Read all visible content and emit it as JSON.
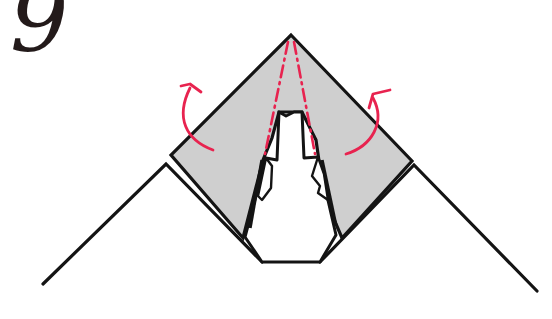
{
  "diagram": {
    "step_number": "9",
    "colors": {
      "paper_fill": "#cfcfcf",
      "outline": "#141414",
      "fold_marks": "#e8234f",
      "background": "#ffffff"
    },
    "elements": {
      "outer_paper_left_edge": "left mountain edge of base paper",
      "outer_paper_right_edge": "right mountain edge of base paper",
      "gray_flap": "gray kite-shaped folded layer",
      "center_opening": "white opening showing underlying layers",
      "valley_fold_lines": "two dash-dot red fold lines from apex",
      "fold_arrow_left": "red curved arrow, fold back left flap",
      "fold_arrow_right": "red curved arrow, fold back right flap"
    }
  }
}
